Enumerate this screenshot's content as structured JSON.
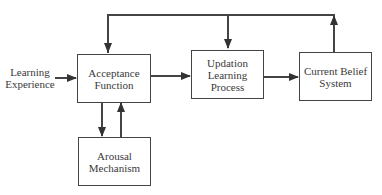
{
  "diagram": {
    "input": {
      "line1": "Learning",
      "line2": "Experience"
    },
    "nodes": {
      "acceptance": {
        "line1": "Acceptance",
        "line2": "Function"
      },
      "updation": {
        "line1": "Updation",
        "line2": "Learning",
        "line3": "Process"
      },
      "belief": {
        "line1": "Current Belief",
        "line2": "System"
      },
      "arousal": {
        "line1": "Arousal",
        "line2": "Mechanism"
      }
    },
    "edges": [
      {
        "from": "Learning Experience",
        "to": "Acceptance Function"
      },
      {
        "from": "Acceptance Function",
        "to": "Updation Learning Process"
      },
      {
        "from": "Updation Learning Process",
        "to": "Current Belief System"
      },
      {
        "from": "Current Belief System",
        "to": "Acceptance Function",
        "via": "top feedback line"
      },
      {
        "from": "Current Belief System",
        "to": "Updation Learning Process",
        "via": "top feedback line"
      },
      {
        "from": "Acceptance Function",
        "to": "Arousal Mechanism"
      },
      {
        "from": "Arousal Mechanism",
        "to": "Acceptance Function"
      }
    ],
    "colors": {
      "line": "#444444",
      "text": "#3a3a3a",
      "background": "#ffffff"
    }
  }
}
